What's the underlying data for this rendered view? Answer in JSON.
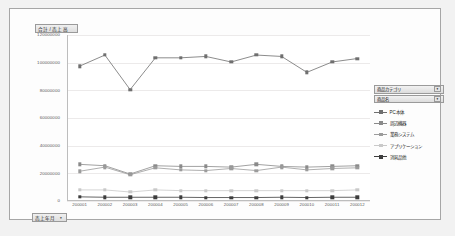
{
  "value_field_button": {
    "label": "合計 / 売上高",
    "arrow": ""
  },
  "axis_field_button": {
    "label": "売上年月",
    "arrow": "▾"
  },
  "filters": [
    {
      "name": "category-filter",
      "label": "商品カテゴリ",
      "arrow": "▾"
    },
    {
      "name": "product-filter",
      "label": "商品名",
      "arrow": "▾"
    }
  ],
  "chart_data": {
    "type": "line",
    "title": "合計 / 売上高",
    "xlabel": "売上年月",
    "ylabel": "",
    "grid": true,
    "legend_position": "right",
    "ylim": [
      0,
      120000000
    ],
    "yticks": [
      0,
      20000000,
      40000000,
      60000000,
      80000000,
      100000000,
      120000000
    ],
    "ytick_labels": [
      "0",
      "20000000",
      "40000000",
      "60000000",
      "80000000",
      "100000000",
      "120000000"
    ],
    "categories": [
      "200001",
      "200002",
      "200003",
      "200004",
      "200005",
      "200006",
      "200007",
      "200008",
      "200009",
      "200010",
      "200011",
      "200012"
    ],
    "series": [
      {
        "name": "PC本体",
        "color": "#6f6f6f",
        "values": [
          97500000,
          105500000,
          80500000,
          103500000,
          103500000,
          104500000,
          100500000,
          105500000,
          104500000,
          93000000,
          100500000,
          103000000
        ]
      },
      {
        "name": "周辺機器",
        "color": "#8a8a8a",
        "values": [
          26500000,
          25500000,
          19500000,
          25500000,
          25000000,
          25000000,
          24500000,
          26500000,
          25000000,
          24500000,
          25000000,
          25500000
        ]
      },
      {
        "name": "業務システム",
        "color": "#9b9b9b",
        "values": [
          21500000,
          24500000,
          19000000,
          24000000,
          22500000,
          22000000,
          23500000,
          22000000,
          24500000,
          22500000,
          23500000,
          24000000
        ]
      },
      {
        "name": "アプリケーション",
        "color": "#c9c9c9",
        "values": [
          8000000,
          8000000,
          6500000,
          8000000,
          7500000,
          7500000,
          7500000,
          7500000,
          7500000,
          7500000,
          7500000,
          8000000
        ]
      },
      {
        "name": "消耗品他",
        "color": "#3d3d3d",
        "values": [
          3000000,
          2700000,
          2700000,
          2700000,
          2700000,
          2500000,
          2500000,
          2500000,
          2700000,
          2500000,
          2700000,
          2700000
        ]
      }
    ]
  }
}
